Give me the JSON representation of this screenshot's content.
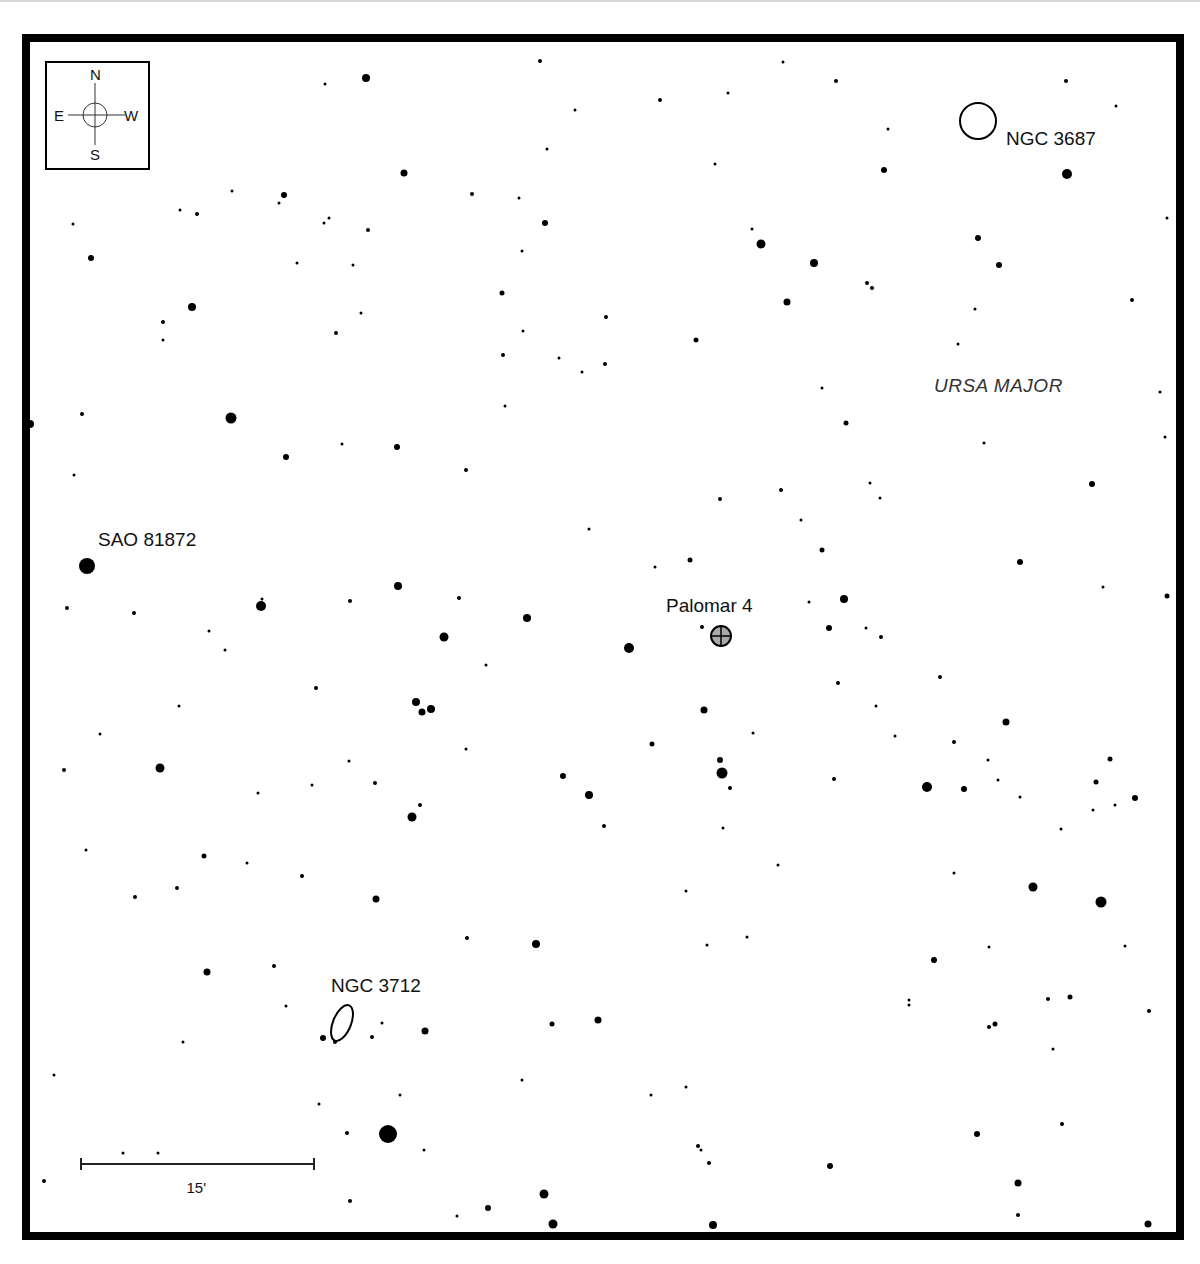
{
  "chart_title": "Finder chart: Palomar 4 field",
  "colors": {
    "frame": "#000000",
    "star": "#000000",
    "cluster_fill": "#a9a9a9",
    "constellation_text": "#333333"
  },
  "compass": {
    "north": "N",
    "south": "S",
    "east": "E",
    "west": "W"
  },
  "constellation": {
    "name": "URSA MAJOR",
    "x": 934,
    "y": 376
  },
  "objects": [
    {
      "id": "palomar-4",
      "label": "Palomar 4",
      "type": "globular-cluster",
      "x": 721,
      "y": 636,
      "label_x": 666,
      "label_y": 596
    },
    {
      "id": "ngc-3687",
      "label": "NGC 3687",
      "type": "galaxy-round",
      "x": 978,
      "y": 121,
      "label_x": 1006,
      "label_y": 129
    },
    {
      "id": "ngc-3712",
      "label": "NGC 3712",
      "type": "galaxy-elliptical",
      "x": 342,
      "y": 1023,
      "label_x": 331,
      "label_y": 976
    },
    {
      "id": "sao-81872",
      "label": "SAO 81872",
      "type": "star",
      "x": 87,
      "y": 566,
      "label_x": 98,
      "label_y": 530
    }
  ],
  "scale_bar": {
    "label": "15'",
    "x1": 81,
    "x2": 314,
    "y": 1164
  },
  "stars": [
    [
      366,
      78,
      4
    ],
    [
      540,
      61,
      2
    ],
    [
      325,
      84,
      1.5
    ],
    [
      575,
      110,
      1.5
    ],
    [
      660,
      100,
      2
    ],
    [
      728,
      93,
      1.5
    ],
    [
      783,
      62,
      1.5
    ],
    [
      836,
      81,
      2
    ],
    [
      888,
      129,
      1.5
    ],
    [
      1066,
      81,
      2
    ],
    [
      1116,
      106,
      1.5
    ],
    [
      1067,
      174,
      5
    ],
    [
      404,
      173,
      3.5
    ],
    [
      547,
      149,
      1.5
    ],
    [
      715,
      164,
      1.5
    ],
    [
      884,
      170,
      3
    ],
    [
      284,
      195,
      3
    ],
    [
      232,
      191,
      1.5
    ],
    [
      279,
      203,
      1.5
    ],
    [
      472,
      194,
      2
    ],
    [
      519,
      198,
      1.5
    ],
    [
      180,
      210,
      1.5
    ],
    [
      197,
      214,
      2
    ],
    [
      73,
      224,
      1.5
    ],
    [
      324,
      223,
      1.5
    ],
    [
      329,
      218,
      1.5
    ],
    [
      368,
      230,
      2
    ],
    [
      545,
      223,
      3
    ],
    [
      752,
      229,
      1.5
    ],
    [
      761,
      244,
      4.5
    ],
    [
      978,
      238,
      3
    ],
    [
      91,
      258,
      3
    ],
    [
      297,
      263,
      1.5
    ],
    [
      353,
      265,
      1.5
    ],
    [
      522,
      251,
      1.5
    ],
    [
      814,
      263,
      4
    ],
    [
      999,
      265,
      3
    ],
    [
      1167,
      218,
      1.5
    ],
    [
      192,
      307,
      4
    ],
    [
      502,
      293,
      2.5
    ],
    [
      606,
      317,
      2
    ],
    [
      787,
      302,
      3.5
    ],
    [
      867,
      283,
      2
    ],
    [
      872,
      288,
      2
    ],
    [
      1132,
      300,
      2
    ],
    [
      163,
      322,
      2
    ],
    [
      163,
      340,
      1.5
    ],
    [
      336,
      333,
      2
    ],
    [
      361,
      313,
      1.5
    ],
    [
      523,
      331,
      1.5
    ],
    [
      696,
      340,
      2.5
    ],
    [
      975,
      309,
      1.5
    ],
    [
      503,
      355,
      2
    ],
    [
      559,
      358,
      1.5
    ],
    [
      582,
      372,
      1.5
    ],
    [
      605,
      364,
      2
    ],
    [
      958,
      344,
      1.5
    ],
    [
      822,
      388,
      1.5
    ],
    [
      231,
      418,
      5.5
    ],
    [
      82,
      414,
      2
    ],
    [
      30,
      424,
      4
    ],
    [
      505,
      406,
      1.5
    ],
    [
      397,
      447,
      3
    ],
    [
      342,
      444,
      1.5
    ],
    [
      286,
      457,
      3
    ],
    [
      466,
      470,
      2
    ],
    [
      846,
      423,
      2.5
    ],
    [
      984,
      443,
      1.5
    ],
    [
      1165,
      437,
      1.5
    ],
    [
      1160,
      392,
      1.5
    ],
    [
      74,
      475,
      1.5
    ],
    [
      720,
      499,
      2
    ],
    [
      781,
      490,
      2
    ],
    [
      870,
      483,
      1.5
    ],
    [
      880,
      498,
      1.5
    ],
    [
      1092,
      484,
      3
    ],
    [
      801,
      520,
      1.5
    ],
    [
      589,
      529,
      1.5
    ],
    [
      822,
      550,
      2.5
    ],
    [
      262,
      599,
      1.5
    ],
    [
      261,
      606,
      5
    ],
    [
      398,
      586,
      4
    ],
    [
      459,
      598,
      2
    ],
    [
      350,
      601,
      2
    ],
    [
      134,
      613,
      2
    ],
    [
      67,
      608,
      2
    ],
    [
      690,
      560,
      2.5
    ],
    [
      655,
      567,
      1.5
    ],
    [
      1020,
      562,
      3
    ],
    [
      1103,
      587,
      1.5
    ],
    [
      1167,
      596,
      2.5
    ],
    [
      844,
      599,
      4
    ],
    [
      809,
      602,
      1.5
    ],
    [
      444,
      637,
      4.5
    ],
    [
      527,
      618,
      4
    ],
    [
      629,
      648,
      5
    ],
    [
      702,
      627,
      2
    ],
    [
      829,
      628,
      3
    ],
    [
      866,
      628,
      1.5
    ],
    [
      881,
      637,
      2
    ],
    [
      209,
      631,
      1.5
    ],
    [
      225,
      650,
      1.5
    ],
    [
      486,
      665,
      1.5
    ],
    [
      316,
      688,
      2
    ],
    [
      416,
      702,
      4
    ],
    [
      422,
      712,
      3.5
    ],
    [
      431,
      709,
      4
    ],
    [
      838,
      683,
      2
    ],
    [
      940,
      677,
      2
    ],
    [
      179,
      706,
      1.5
    ],
    [
      704,
      710,
      3.5
    ],
    [
      876,
      706,
      1.5
    ],
    [
      1006,
      722,
      3.5
    ],
    [
      100,
      734,
      1.5
    ],
    [
      466,
      749,
      1.5
    ],
    [
      652,
      744,
      2.5
    ],
    [
      753,
      733,
      1.5
    ],
    [
      895,
      736,
      1.5
    ],
    [
      954,
      742,
      2
    ],
    [
      988,
      760,
      1.5
    ],
    [
      1110,
      759,
      2.5
    ],
    [
      64,
      770,
      2
    ],
    [
      160,
      768,
      4.5
    ],
    [
      349,
      761,
      1.5
    ],
    [
      720,
      760,
      3
    ],
    [
      722,
      773,
      5.5
    ],
    [
      563,
      776,
      3
    ],
    [
      730,
      788,
      2
    ],
    [
      834,
      779,
      2
    ],
    [
      927,
      787,
      5
    ],
    [
      964,
      789,
      3
    ],
    [
      998,
      780,
      1.5
    ],
    [
      1096,
      782,
      2.5
    ],
    [
      1135,
      798,
      3
    ],
    [
      1115,
      805,
      1.5
    ],
    [
      1093,
      810,
      1.5
    ],
    [
      375,
      783,
      2
    ],
    [
      312,
      785,
      1.5
    ],
    [
      258,
      793,
      1.5
    ],
    [
      589,
      795,
      4
    ],
    [
      1020,
      797,
      1.5
    ],
    [
      420,
      805,
      2
    ],
    [
      412,
      817,
      4.5
    ],
    [
      604,
      826,
      2
    ],
    [
      723,
      828,
      1.5
    ],
    [
      1061,
      829,
      1.5
    ],
    [
      86,
      850,
      1.5
    ],
    [
      204,
      856,
      2.5
    ],
    [
      247,
      863,
      1.5
    ],
    [
      778,
      865,
      1.5
    ],
    [
      954,
      873,
      1.5
    ],
    [
      302,
      876,
      2
    ],
    [
      177,
      888,
      2
    ],
    [
      135,
      897,
      2
    ],
    [
      376,
      899,
      3.5
    ],
    [
      686,
      891,
      1.5
    ],
    [
      1033,
      887,
      4.5
    ],
    [
      1101,
      902,
      5.5
    ],
    [
      467,
      938,
      2
    ],
    [
      536,
      944,
      4
    ],
    [
      707,
      945,
      1.5
    ],
    [
      747,
      937,
      1.5
    ],
    [
      1125,
      946,
      1.5
    ],
    [
      934,
      960,
      3
    ],
    [
      989,
      947,
      1.5
    ],
    [
      207,
      972,
      3.5
    ],
    [
      274,
      966,
      2
    ],
    [
      909,
      1000,
      1.5
    ],
    [
      909,
      1005,
      1.5
    ],
    [
      1048,
      999,
      2
    ],
    [
      1070,
      997,
      2.5
    ],
    [
      1149,
      1011,
      2
    ],
    [
      286,
      1006,
      1.5
    ],
    [
      382,
      1023,
      1.5
    ],
    [
      323,
      1038,
      3
    ],
    [
      335,
      1042,
      2
    ],
    [
      372,
      1037,
      2
    ],
    [
      425,
      1031,
      3.5
    ],
    [
      552,
      1024,
      2.5
    ],
    [
      598,
      1020,
      3.5
    ],
    [
      989,
      1027,
      2
    ],
    [
      995,
      1024,
      2.5
    ],
    [
      1053,
      1049,
      1.5
    ],
    [
      183,
      1042,
      1.5
    ],
    [
      54,
      1075,
      1.5
    ],
    [
      686,
      1087,
      1.5
    ],
    [
      651,
      1095,
      1.5
    ],
    [
      522,
      1080,
      1.5
    ],
    [
      400,
      1095,
      1.5
    ],
    [
      319,
      1104,
      1.5
    ],
    [
      123,
      1153,
      1.5
    ],
    [
      158,
      1153,
      1.5
    ],
    [
      347,
      1133,
      2
    ],
    [
      388,
      1134,
      9
    ],
    [
      424,
      1150,
      1.5
    ],
    [
      977,
      1134,
      3
    ],
    [
      1062,
      1124,
      2
    ],
    [
      698,
      1146,
      2
    ],
    [
      701,
      1150,
      1.5
    ],
    [
      709,
      1163,
      2
    ],
    [
      830,
      1166,
      3
    ],
    [
      44,
      1181,
      2
    ],
    [
      350,
      1201,
      2
    ],
    [
      457,
      1216,
      1.5
    ],
    [
      488,
      1208,
      3
    ],
    [
      544,
      1194,
      4.5
    ],
    [
      553,
      1224,
      4.5
    ],
    [
      713,
      1225,
      4
    ],
    [
      1018,
      1183,
      3.5
    ],
    [
      1018,
      1215,
      2
    ],
    [
      1148,
      1224,
      3.5
    ]
  ],
  "footer": {
    "text": ""
  }
}
